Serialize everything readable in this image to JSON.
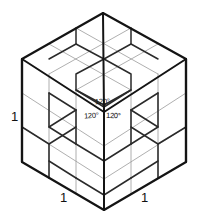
{
  "figure": {
    "colors": {
      "background": "#ffffff",
      "outline": "#141414",
      "major_grid": "#2a2a2a",
      "minor_grid": "#9a9a9a",
      "label": "#111111"
    },
    "geometry": {
      "top_apex": [
        103,
        13
      ],
      "left_corner": [
        22,
        59
      ],
      "right_corner": [
        186,
        59
      ],
      "center_vertex": [
        104,
        112
      ],
      "bottom_left_corner": [
        22,
        162
      ],
      "bottom_right_corner": [
        186,
        162
      ],
      "bottom_apex": [
        104,
        210
      ],
      "divisions": 3
    },
    "angle_labels": [
      {
        "id": "angle-top",
        "text": "120°"
      },
      {
        "id": "angle-left",
        "text": "120°"
      },
      {
        "id": "angle-right",
        "text": "120°"
      }
    ],
    "unit_labels": [
      {
        "id": "unit-left",
        "text": "1"
      },
      {
        "id": "unit-bottom-left",
        "text": "1"
      },
      {
        "id": "unit-bottom-right",
        "text": "1"
      }
    ]
  }
}
